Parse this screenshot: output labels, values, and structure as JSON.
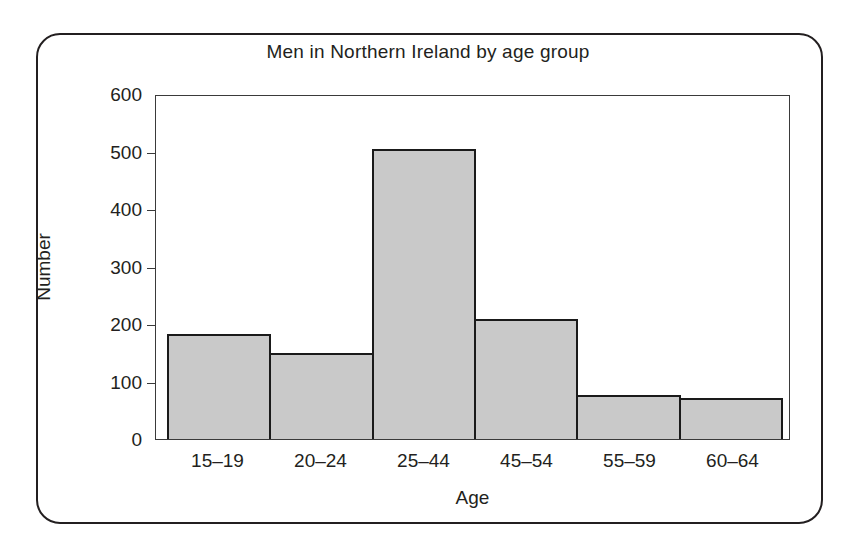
{
  "chart_data": {
    "type": "bar",
    "title": "Men in Northern Ireland by age group",
    "xlabel": "Age",
    "ylabel": "Number",
    "categories": [
      "15–19",
      "20–24",
      "25–44",
      "45–54",
      "55–59",
      "60–64"
    ],
    "values": [
      183,
      150,
      505,
      209,
      77,
      71
    ],
    "ylim": [
      0,
      600
    ],
    "ytick_labels": [
      "600",
      "500",
      "400",
      "300",
      "200",
      "100",
      "0"
    ],
    "ytick_values": [
      600,
      500,
      400,
      300,
      200,
      100,
      0
    ],
    "grid": false,
    "legend": null,
    "bar_fill_color": "#c9c9c9",
    "bar_edge_color": "#1a1a1a",
    "axis_color": "#3a3a3a",
    "text_color": "#231f20",
    "background_color": "#ffffff"
  }
}
